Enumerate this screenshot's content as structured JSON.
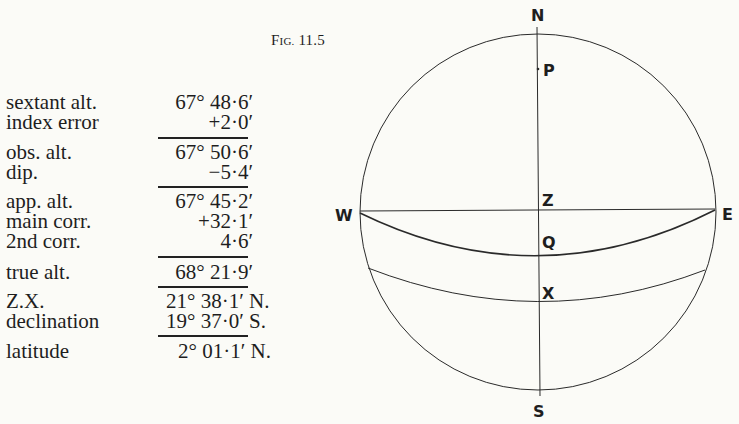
{
  "figure": {
    "caption_prefix": "F",
    "caption_smallcaps": "IG.",
    "caption_number": " 11.5"
  },
  "calculation": {
    "rows": [
      {
        "label": "sextant alt.",
        "value": "67° 48·6′"
      },
      {
        "label": "index error",
        "value": "+2·0′"
      },
      {
        "label": "obs. alt.",
        "value": "67° 50·6′"
      },
      {
        "label": "dip.",
        "value": "−5·4′"
      },
      {
        "label": "app. alt.",
        "value": "67° 45·2′"
      },
      {
        "label": "main corr.",
        "value": "+32·1′"
      },
      {
        "label": "2nd corr.",
        "value": "4·6′"
      },
      {
        "label": "true alt.",
        "value": "68° 21·9′"
      },
      {
        "label": "Z.X.",
        "value": "21° 38·1′ N."
      },
      {
        "label": "declination",
        "value": "19° 37·0′ S."
      },
      {
        "label": "latitude",
        "value": "2° 01·1′ N."
      }
    ]
  },
  "diagram": {
    "labels": {
      "N": "N",
      "S": "S",
      "E": "E",
      "W": "W",
      "Z": "Z",
      "P": "P",
      "Q": "Q",
      "X": "X"
    }
  }
}
